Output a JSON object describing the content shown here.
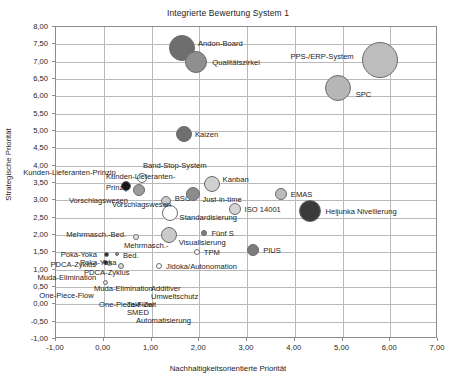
{
  "chart_data": {
    "type": "scatter",
    "title": "Integrierte Bewertung System 1",
    "xlabel": "Nachhaltigkeitsorientierte Priorität",
    "ylabel": "Strategische Priorität",
    "xlim": [
      -1.0,
      7.0
    ],
    "ylim": [
      -1.0,
      8.0
    ],
    "xticks": [
      "-1,00",
      "0,00",
      "1,00",
      "2,00",
      "3,00",
      "4,00",
      "5,00",
      "6,00",
      "7,00"
    ],
    "xtick_values": [
      -1,
      0,
      1,
      2,
      3,
      4,
      5,
      6,
      7
    ],
    "yticks": [
      "8,00",
      "7,50",
      "7,00",
      "6,50",
      "6,00",
      "5,50",
      "5,00",
      "4,50",
      "4,00",
      "3,50",
      "3,00",
      "2,50",
      "2,00",
      "1,50",
      "1,00",
      "0,50",
      "0,00",
      "-0,50",
      "-1,00"
    ],
    "ytick_values": [
      8,
      7.5,
      7,
      6.5,
      6,
      5.5,
      5,
      4.5,
      4,
      3.5,
      3,
      2.5,
      2,
      1.5,
      1,
      0.5,
      0,
      -0.5,
      -1
    ],
    "grid": true,
    "legend": "none",
    "points": [
      {
        "name": "Andon-Board",
        "x": 1.66,
        "y": 7.37,
        "r": 13,
        "color": "#6e6e6e",
        "label_dx": 16,
        "label_dy": -5,
        "align": "left"
      },
      {
        "name": "Qualitätszirkel",
        "x": 1.96,
        "y": 6.97,
        "r": 11,
        "color": "#8f8f8f",
        "label_dx": 16,
        "label_dy": 0,
        "align": "left"
      },
      {
        "name": "PPS-/ERP-System",
        "x": 5.8,
        "y": 7.03,
        "r": 18,
        "color": "#bdbdbd",
        "label_dx": -26,
        "label_dy": -4,
        "align": "right"
      },
      {
        "name": "SPC",
        "x": 4.92,
        "y": 6.22,
        "r": 13,
        "color": "#b6b6b6",
        "label_dx": 18,
        "label_dy": 6,
        "align": "left"
      },
      {
        "name": "Kaizen",
        "x": 1.7,
        "y": 4.88,
        "r": 8,
        "color": "#6f6f6f",
        "label_dx": 11,
        "label_dy": 0,
        "align": "left"
      },
      {
        "name": "Band-Stop-System",
        "x": 0.82,
        "y": 3.62,
        "r": 5,
        "color": "#ffffff",
        "label_dx": 1,
        "label_dy": -13,
        "align": "left"
      },
      {
        "name": "Kunden-Lieferanten-Prinzip",
        "x": 0.48,
        "y": 3.38,
        "r": 5,
        "color": "#151515",
        "label_dx": -10,
        "label_dy": -14,
        "align": "right"
      },
      {
        "name": "Vorschlagswesen",
        "x": 0.76,
        "y": 3.28,
        "r": 6,
        "color": "#9b9b9b",
        "label_dx": -11,
        "label_dy": 10,
        "align": "right"
      },
      {
        "name": "Kanban",
        "x": 2.28,
        "y": 3.44,
        "r": 8,
        "color": "#cfcfcf",
        "label_dx": 11,
        "label_dy": -5,
        "align": "left"
      },
      {
        "name": "BSC",
        "x": 1.32,
        "y": 2.95,
        "r": 5,
        "color": "#c9c9c9",
        "label_dx": 9,
        "label_dy": -3,
        "align": "left"
      },
      {
        "name": "Just-in-time",
        "x": 1.9,
        "y": 3.14,
        "r": 7,
        "color": "#8c8c8c",
        "label_dx": 9,
        "label_dy": 5,
        "align": "left"
      },
      {
        "name": "Standardisierung",
        "x": 1.4,
        "y": 2.6,
        "r": 8,
        "color": "#ffffff",
        "label_dx": 10,
        "label_dy": 4,
        "align": "left"
      },
      {
        "name": "EMAS",
        "x": 3.73,
        "y": 3.16,
        "r": 6,
        "color": "#bababa",
        "label_dx": 10,
        "label_dy": 0,
        "align": "left"
      },
      {
        "name": "ISO 14001",
        "x": 2.76,
        "y": 2.72,
        "r": 6,
        "color": "#d4d4d4",
        "label_dx": 10,
        "label_dy": 0,
        "align": "left"
      },
      {
        "name": "Heijunka Nivellierung",
        "x": 4.35,
        "y": 2.66,
        "r": 11,
        "color": "#3a3a3a",
        "label_dx": 15,
        "label_dy": 0,
        "align": "left"
      },
      {
        "name": "Visualisierung",
        "x": 1.38,
        "y": 1.98,
        "r": 8,
        "color": "#cacaca",
        "label_dx": 10,
        "label_dy": 7,
        "align": "left"
      },
      {
        "name": "Fünf S",
        "x": 2.13,
        "y": 2.04,
        "r": 3,
        "color": "#7e7e7e",
        "label_dx": 7,
        "label_dy": 0,
        "align": "left"
      },
      {
        "name": "Mehrmasch.-Bed.",
        "x": 0.7,
        "y": 1.9,
        "r": 3,
        "color": "#e8e8e8",
        "label_dx": -10,
        "label_dy": -3,
        "align": "right"
      },
      {
        "name": "TPM",
        "x": 1.97,
        "y": 1.47,
        "r": 3,
        "color": "#ffffff",
        "label_dx": 7,
        "label_dy": 0,
        "align": "left"
      },
      {
        "name": "PIUS",
        "x": 3.15,
        "y": 1.53,
        "r": 6,
        "color": "#7c7c7c",
        "label_dx": 10,
        "label_dy": 0,
        "align": "left"
      },
      {
        "name": "Poka-Yoka",
        "x": 0.07,
        "y": 1.41,
        "r": 2.5,
        "color": "#2b2b2b",
        "label_dx": -9,
        "label_dy": 0,
        "align": "right"
      },
      {
        "name": "Takt-Zeit",
        "x": 0.3,
        "y": 1.43,
        "r": 2,
        "color": "#9a9a9a",
        "label_dx": 0,
        "label_dy": 0,
        "align": "none"
      },
      {
        "name": "PDCA-Zyklus",
        "x": 0.05,
        "y": 1.19,
        "r": 2.5,
        "color": "#2b2b2b",
        "label_dx": -9,
        "label_dy": 2,
        "align": "right"
      },
      {
        "name": "SMED",
        "x": 0.14,
        "y": 1.15,
        "r": 2.5,
        "color": "#ffffff",
        "label_dx": 0,
        "label_dy": 0,
        "align": "none"
      },
      {
        "name": "Automatisierung",
        "x": 0.38,
        "y": 1.07,
        "r": 3,
        "color": "#d9d9d9",
        "label_dx": 0,
        "label_dy": 0,
        "align": "none"
      },
      {
        "name": "Jidoka/Autonomation",
        "x": 1.18,
        "y": 1.07,
        "r": 3,
        "color": "#ffffff",
        "label_dx": 7,
        "label_dy": 0,
        "align": "left"
      },
      {
        "name": "Muda-Elimination",
        "x": 0.05,
        "y": 0.59,
        "r": 2.5,
        "color": "#e0e0e0",
        "label_dx": -9,
        "label_dy": -6,
        "align": "right"
      },
      {
        "name": "One-Piece-Flow",
        "x": 0.0,
        "y": 0.25,
        "r": 0,
        "color": "#ffffff",
        "label_dx": -9,
        "label_dy": 0,
        "align": "right"
      },
      {
        "name": "Additiver Umweltschutz",
        "x": 0.0,
        "y": 0.0,
        "r": 0,
        "color": "#ffffff",
        "label_dx": 0,
        "label_dy": 0,
        "align": "none"
      }
    ],
    "free_labels": [
      {
        "text": "Additiver",
        "x": 151,
        "y": 288
      },
      {
        "text": "Umweltschutz",
        "x": 151,
        "y": 296
      },
      {
        "text": "Takt-Zeit",
        "x": 127,
        "y": 304
      },
      {
        "text": "SMED",
        "x": 127,
        "y": 312
      },
      {
        "text": "Automatisierung",
        "x": 136,
        "y": 320
      },
      {
        "text": "One-Piece-Flow",
        "x": 99,
        "y": 304
      },
      {
        "text": "Muda-Elimination",
        "x": 94,
        "y": 288
      },
      {
        "text": "Bed.",
        "x": 123,
        "y": 255
      },
      {
        "text": "Mehrmasch.-",
        "x": 124,
        "y": 245
      },
      {
        "text": "Poka-Yoka",
        "x": 80,
        "y": 262
      },
      {
        "text": "PDCA-Zyklus",
        "x": 84,
        "y": 272
      },
      {
        "text": "Kunden-Lieferanten-",
        "x": 106,
        "y": 176
      },
      {
        "text": "Prinzip",
        "x": 106,
        "y": 187
      },
      {
        "text": "Vorschlagswesen",
        "x": 112,
        "y": 204
      }
    ]
  }
}
